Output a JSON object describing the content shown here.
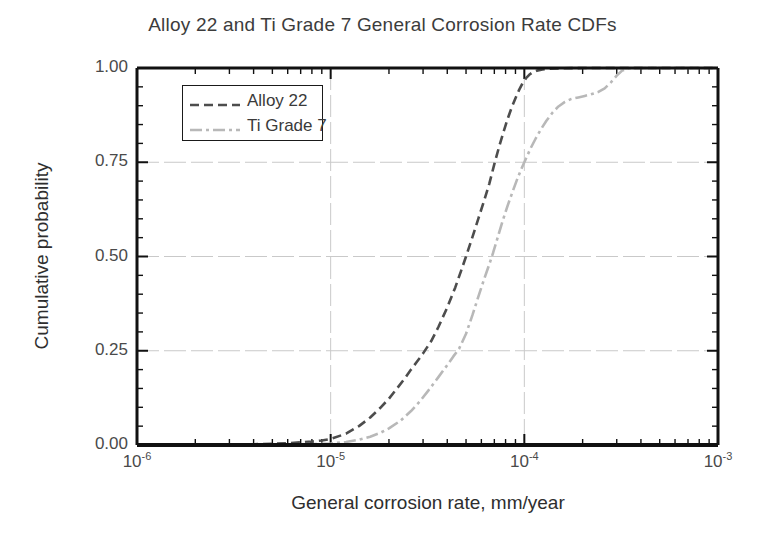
{
  "chart_data": {
    "type": "line",
    "title": "Alloy 22 and Ti Grade 7 General Corrosion Rate CDFs",
    "xlabel": "General corrosion rate, mm/year",
    "ylabel": "Cumulative probability",
    "xscale": "log",
    "yscale": "linear",
    "xlim": [
      1e-06,
      0.001
    ],
    "ylim": [
      0.0,
      1.0
    ],
    "grid": true,
    "grid_x_values": [
      1e-05,
      0.0001
    ],
    "grid_y_values": [
      0.25,
      0.5,
      0.75
    ],
    "legend_position": "upper-left-inside",
    "xticks": [
      {
        "value": 1e-06,
        "label": "10",
        "exponent": "-6"
      },
      {
        "value": 1e-05,
        "label": "10",
        "exponent": "-5"
      },
      {
        "value": 0.0001,
        "label": "10",
        "exponent": "-4"
      },
      {
        "value": 0.001,
        "label": "10",
        "exponent": "-3"
      }
    ],
    "yticks": [
      {
        "value": 0.0,
        "label": "0.00"
      },
      {
        "value": 0.25,
        "label": "0.25"
      },
      {
        "value": 0.5,
        "label": "0.50"
      },
      {
        "value": 0.75,
        "label": "0.75"
      },
      {
        "value": 1.0,
        "label": "1.00"
      }
    ],
    "series": [
      {
        "name": "Alloy 22",
        "color": "#4d4d4d",
        "dash": "9,5",
        "width": 2.6,
        "points": [
          [
            1e-06,
            0.0
          ],
          [
            2e-06,
            0.0
          ],
          [
            3e-06,
            0.001
          ],
          [
            4e-06,
            0.002
          ],
          [
            5e-06,
            0.003
          ],
          [
            6e-06,
            0.005
          ],
          [
            7e-06,
            0.007
          ],
          [
            8e-06,
            0.009
          ],
          [
            9e-06,
            0.012
          ],
          [
            1e-05,
            0.016
          ],
          [
            1.2e-05,
            0.03
          ],
          [
            1.4e-05,
            0.05
          ],
          [
            1.6e-05,
            0.073
          ],
          [
            1.8e-05,
            0.098
          ],
          [
            2e-05,
            0.123
          ],
          [
            2.2e-05,
            0.15
          ],
          [
            2.4e-05,
            0.175
          ],
          [
            2.6e-05,
            0.2
          ],
          [
            2.8e-05,
            0.222
          ],
          [
            3e-05,
            0.243
          ],
          [
            3.3e-05,
            0.275
          ],
          [
            3.6e-05,
            0.313
          ],
          [
            4e-05,
            0.365
          ],
          [
            4.4e-05,
            0.418
          ],
          [
            4.7e-05,
            0.46
          ],
          [
            5e-05,
            0.5
          ],
          [
            5.4e-05,
            0.552
          ],
          [
            5.8e-05,
            0.602
          ],
          [
            6.2e-05,
            0.648
          ],
          [
            6.6e-05,
            0.694
          ],
          [
            7e-05,
            0.745
          ],
          [
            7.4e-05,
            0.79
          ],
          [
            7.8e-05,
            0.83
          ],
          [
            8.2e-05,
            0.865
          ],
          [
            8.6e-05,
            0.895
          ],
          [
            9e-05,
            0.92
          ],
          [
            9.4e-05,
            0.942
          ],
          [
            9.8e-05,
            0.96
          ],
          [
            0.000102,
            0.973
          ],
          [
            0.000106,
            0.982
          ],
          [
            0.00011,
            0.988
          ],
          [
            0.000116,
            0.993
          ],
          [
            0.000124,
            0.996
          ],
          [
            0.000135,
            0.998
          ],
          [
            0.00015,
            0.999
          ],
          [
            0.0002,
            1.0
          ],
          [
            0.0004,
            1.0
          ],
          [
            0.001,
            1.0
          ]
        ]
      },
      {
        "name": "Ti Grade 7",
        "color": "#b8b8b8",
        "dash": "12,4,3,4",
        "width": 2.6,
        "points": [
          [
            1e-06,
            0.0
          ],
          [
            3e-06,
            0.0
          ],
          [
            5e-06,
            0.001
          ],
          [
            7e-06,
            0.002
          ],
          [
            9e-06,
            0.003
          ],
          [
            1e-05,
            0.004
          ],
          [
            1.2e-05,
            0.008
          ],
          [
            1.4e-05,
            0.014
          ],
          [
            1.6e-05,
            0.022
          ],
          [
            1.8e-05,
            0.032
          ],
          [
            2e-05,
            0.044
          ],
          [
            2.3e-05,
            0.065
          ],
          [
            2.6e-05,
            0.09
          ],
          [
            2.9e-05,
            0.117
          ],
          [
            3.2e-05,
            0.145
          ],
          [
            3.6e-05,
            0.18
          ],
          [
            4e-05,
            0.212
          ],
          [
            4.3e-05,
            0.235
          ],
          [
            4.6e-05,
            0.255
          ],
          [
            5e-05,
            0.295
          ],
          [
            5.4e-05,
            0.345
          ],
          [
            5.8e-05,
            0.395
          ],
          [
            6.2e-05,
            0.44
          ],
          [
            6.6e-05,
            0.48
          ],
          [
            6.9e-05,
            0.51
          ],
          [
            7.3e-05,
            0.552
          ],
          [
            7.7e-05,
            0.592
          ],
          [
            8.2e-05,
            0.635
          ],
          [
            8.7e-05,
            0.672
          ],
          [
            9.2e-05,
            0.706
          ],
          [
            9.7e-05,
            0.735
          ],
          [
            0.000102,
            0.76
          ],
          [
            0.000108,
            0.788
          ],
          [
            0.000115,
            0.815
          ],
          [
            0.000122,
            0.838
          ],
          [
            0.00013,
            0.86
          ],
          [
            0.00014,
            0.882
          ],
          [
            0.00015,
            0.898
          ],
          [
            0.000162,
            0.91
          ],
          [
            0.000175,
            0.918
          ],
          [
            0.00019,
            0.922
          ],
          [
            0.000205,
            0.926
          ],
          [
            0.00022,
            0.93
          ],
          [
            0.00024,
            0.936
          ],
          [
            0.00026,
            0.946
          ],
          [
            0.00028,
            0.962
          ],
          [
            0.0003,
            0.98
          ],
          [
            0.00032,
            0.993
          ],
          [
            0.000345,
            0.999
          ],
          [
            0.00038,
            1.0
          ],
          [
            0.0006,
            1.0
          ],
          [
            0.001,
            1.0
          ]
        ]
      }
    ]
  },
  "axes": {
    "frame_color": "#111111",
    "grid_color": "#c9c9c9",
    "background": "#ffffff"
  }
}
